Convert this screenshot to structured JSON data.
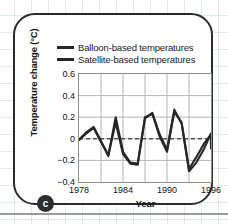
{
  "panel": {
    "badge_label": "c"
  },
  "legend": {
    "position": "top-center",
    "items": [
      {
        "label": "Balloon-based temperatures",
        "color": "#262626"
      },
      {
        "label": "Satellite-based temperatures",
        "color": "#262626"
      }
    ]
  },
  "axes": {
    "ylabel": "Temperature change (°C)",
    "xlabel": "Year",
    "yticks": [
      "0.6",
      "0.4",
      "0.2",
      "0",
      "−0.2",
      "−0.4"
    ],
    "xticks": [
      "1978",
      "1984",
      "1990",
      "1996"
    ]
  },
  "chart_data": {
    "type": "line",
    "title": "",
    "xlabel": "Year",
    "ylabel": "Temperature change (°C)",
    "xlim": [
      1978,
      1996
    ],
    "ylim": [
      -0.4,
      0.6
    ],
    "yticks": [
      -0.4,
      -0.2,
      0,
      0.2,
      0.4,
      0.6
    ],
    "xticks": [
      1978,
      1984,
      1990,
      1996
    ],
    "grid": true,
    "zero_reference_line": {
      "value": 0,
      "style": "dashed"
    },
    "legend_position": "top-center",
    "x": [
      1978,
      1979,
      1980,
      1981,
      1982,
      1983,
      1984,
      1985,
      1986,
      1987,
      1988,
      1989,
      1990,
      1991,
      1992,
      1993,
      1994,
      1995,
      1996
    ],
    "series": [
      {
        "name": "Balloon-based temperatures",
        "color": "#262626",
        "values": [
          -0.01,
          0.06,
          0.11,
          -0.02,
          -0.16,
          0.2,
          -0.12,
          -0.22,
          -0.23,
          0.19,
          0.24,
          0.04,
          -0.1,
          0.27,
          0.14,
          -0.3,
          -0.22,
          -0.1,
          0.05
        ]
      },
      {
        "name": "Satellite-based temperatures",
        "color": "#262626",
        "values": [
          -0.01,
          0.05,
          0.1,
          -0.03,
          -0.15,
          0.15,
          -0.14,
          -0.23,
          -0.24,
          0.2,
          0.23,
          0.02,
          -0.12,
          0.25,
          0.15,
          -0.28,
          -0.17,
          -0.05,
          0.04
        ]
      }
    ],
    "series_end_values": [
      -0.09,
      -0.06
    ]
  }
}
